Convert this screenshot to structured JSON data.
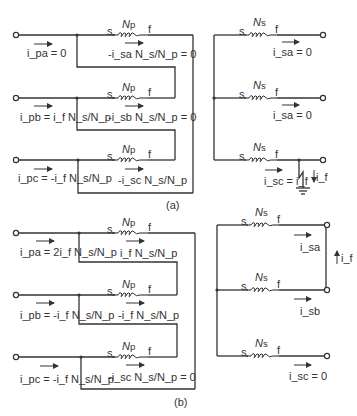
{
  "diagram": {
    "type": "transformer-circuit",
    "panels": [
      {
        "caption": "(a)",
        "primary": {
          "winding_label": "Np",
          "terminal_start": "s",
          "terminal_end": "f",
          "phases": [
            {
              "line_current": "i_pa = 0",
              "winding_current": "-i_sa N_s/N_p = 0"
            },
            {
              "line_current": "i_pb = i_f N_s/N_p",
              "winding_current": "-i_sb N_s/N_p = 0"
            },
            {
              "line_current": "i_pc = -i_f N_s/N_p",
              "winding_current": "-i_sc N_s/N_p"
            }
          ]
        },
        "secondary": {
          "winding_label": "Ns",
          "terminal_start": "s",
          "terminal_end": "f",
          "phases": [
            {
              "current": "i_sa = 0"
            },
            {
              "current": "i_sa = 0"
            },
            {
              "current": "i_sc = i_f"
            }
          ],
          "fault": {
            "type": "single-line-to-ground",
            "current": "i_f"
          }
        }
      },
      {
        "caption": "(b)",
        "primary": {
          "winding_label": "Np",
          "terminal_start": "s",
          "terminal_end": "f",
          "phases": [
            {
              "line_current": "i_pa = 2i_f N_s/N_p",
              "winding_current": "i_f N_s/N_p"
            },
            {
              "line_current": "i_pb = -i_f N_s/N_p",
              "winding_current": "-i_f N_s/N_p"
            },
            {
              "line_current": "i_pc = -i_f N_s/N_p",
              "winding_current": "-i_sc N_s/N_p = 0"
            }
          ]
        },
        "secondary": {
          "winding_label": "Ns",
          "terminal_start": "s",
          "terminal_end": "f",
          "phases": [
            {
              "current": "i_sa"
            },
            {
              "current": "i_sb"
            },
            {
              "current": "i_sc = 0"
            }
          ],
          "fault": {
            "type": "line-to-line",
            "current": "i_f"
          }
        }
      }
    ]
  },
  "text": {
    "s": "s",
    "f": "f",
    "N": "N",
    "p": "p",
    "sub_s": "s",
    "cap_a": "(a)",
    "cap_b": "(b)"
  }
}
